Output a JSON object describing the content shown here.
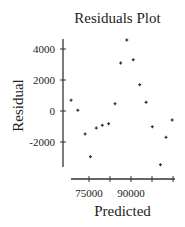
{
  "chart_data": {
    "type": "scatter",
    "title": "Residuals Plot",
    "xlabel": "Predicted",
    "ylabel": "Residual",
    "xlim": [
      67000,
      105500
    ],
    "ylim": [
      -3800,
      4700
    ],
    "x_ticks": [
      75000,
      82500,
      90000,
      97500,
      105000
    ],
    "x_tick_labels": [
      "75000",
      "",
      "90000",
      "",
      ""
    ],
    "y_ticks": [
      4000,
      2000,
      0,
      -2000
    ],
    "y_tick_labels": [
      "4000",
      "2000",
      "0",
      "-2000"
    ],
    "grid": false,
    "legend": null,
    "marker": "+",
    "series": [
      {
        "name": "Residuals",
        "x": [
          68600,
          71000,
          73600,
          75500,
          77600,
          79750,
          82000,
          84300,
          86300,
          88500,
          90800,
          93100,
          95400,
          97600,
          100500,
          102500,
          104700
        ],
        "y": [
          700,
          50,
          -1480,
          -2950,
          -1100,
          -920,
          -820,
          470,
          3100,
          4580,
          3310,
          1700,
          560,
          -1010,
          -3460,
          -1700,
          -580
        ]
      }
    ]
  },
  "colors": {
    "axis": "#333333",
    "marker": "#222222",
    "text": "#222222",
    "background": "#ffffff"
  }
}
